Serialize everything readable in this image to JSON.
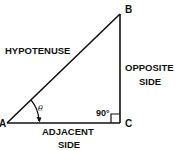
{
  "diagram": {
    "type": "right-triangle",
    "vertices": {
      "A": {
        "label": "A"
      },
      "B": {
        "label": "B"
      },
      "C": {
        "label": "C"
      }
    },
    "sides": {
      "hypotenuse": {
        "label": "HYPOTENUSE"
      },
      "opposite": {
        "line1": "OPPOSITE",
        "line2": "SIDE"
      },
      "adjacent": {
        "line1": "ADJACENT",
        "line2": "SIDE"
      }
    },
    "angles": {
      "theta": {
        "symbol": "θ"
      },
      "right_angle": {
        "label": "90°"
      }
    },
    "colors": {
      "stroke": "#111111",
      "background": "#ffffff"
    }
  }
}
